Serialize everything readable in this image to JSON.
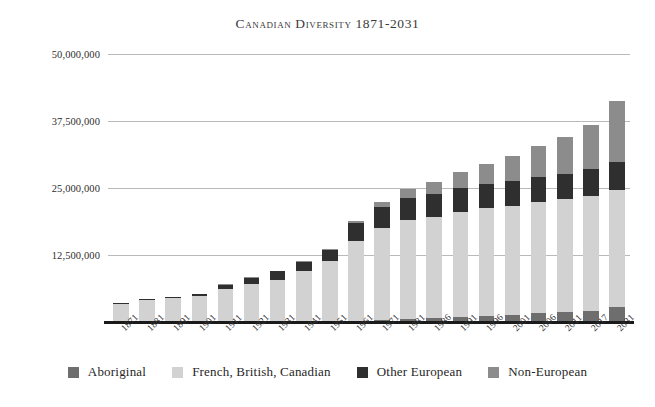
{
  "chart_data": {
    "type": "bar",
    "subtype": "stacked-bar",
    "title": "Canadian Diversity 1871-2031",
    "xlabel": "",
    "ylabel": "",
    "ylim": [
      0,
      50000000
    ],
    "ytick_labels": [
      "12,500,000",
      "25,000,000",
      "37,500,000",
      "50,000,000"
    ],
    "ytick_values": [
      12500000,
      25000000,
      37500000,
      50000000
    ],
    "grid": true,
    "legend_position": "bottom",
    "categories": [
      "1871",
      "1881",
      "1891",
      "1901",
      "1911",
      "1921",
      "1931",
      "1941",
      "1951",
      "1961",
      "1971",
      "1981",
      "1986",
      "1991",
      "1996",
      "2001",
      "2006",
      "2011",
      "2017",
      "2031"
    ],
    "series": [
      {
        "name": "Aboriginal",
        "color": "#6e6e6e",
        "values": [
          100000,
          110000,
          120000,
          130000,
          110000,
          110000,
          130000,
          130000,
          160000,
          220000,
          310000,
          490000,
          710000,
          1000000,
          1100000,
          1320000,
          1670000,
          1900000,
          2130000,
          2750000
        ]
      },
      {
        "name": "French, British, Canadian",
        "color": "#d2d2d2",
        "values": [
          3250000,
          3950000,
          4300000,
          4800000,
          6000000,
          7000000,
          7800000,
          9300000,
          11300000,
          14900000,
          17300000,
          18500000,
          18900000,
          19600000,
          20100000,
          20400000,
          20700000,
          21000000,
          21400000,
          21800000
        ]
      },
      {
        "name": "Other European",
        "color": "#2f2f2f",
        "values": [
          250000,
          270000,
          290000,
          320000,
          800000,
          1100000,
          1500000,
          1700000,
          2000000,
          3300000,
          3900000,
          4200000,
          4300000,
          4400000,
          4500000,
          4600000,
          4700000,
          4800000,
          5000000,
          5300000
        ]
      },
      {
        "name": "Non-European",
        "color": "#8c8c8c",
        "values": [
          30000,
          40000,
          50000,
          60000,
          100000,
          120000,
          150000,
          180000,
          240000,
          480000,
          900000,
          1600000,
          2200000,
          2900000,
          3700000,
          4600000,
          5700000,
          6800000,
          8200000,
          11300000
        ]
      }
    ],
    "totals": [
      3630000,
      4370000,
      4760000,
      5310000,
      7010000,
      8330000,
      9580000,
      11310000,
      13700000,
      18900000,
      22410000,
      24790000,
      26110000,
      27900000,
      29400000,
      30920000,
      32770000,
      34500000,
      36730000,
      41150000
    ]
  },
  "legend": {
    "items": [
      {
        "label": "Aboriginal",
        "color": "#6e6e6e"
      },
      {
        "label": "French, British, Canadian",
        "color": "#d2d2d2"
      },
      {
        "label": "Other European",
        "color": "#2f2f2f"
      },
      {
        "label": "Non-European",
        "color": "#8c8c8c"
      }
    ]
  }
}
